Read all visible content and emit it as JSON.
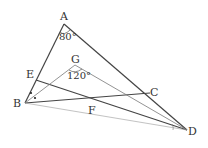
{
  "diagram": {
    "points": {
      "A": {
        "label": "A",
        "x": 64,
        "y": 24
      },
      "B": {
        "label": "B",
        "x": 25,
        "y": 103
      },
      "C": {
        "label": "C",
        "x": 150,
        "y": 93
      },
      "D": {
        "label": "D",
        "x": 187,
        "y": 130
      },
      "E": {
        "label": "E",
        "x": 36,
        "y": 80
      },
      "F": {
        "label": "F",
        "x": 96,
        "y": 103
      },
      "G": {
        "label": "G",
        "x": 75,
        "y": 65
      }
    },
    "angles": {
      "A": "80°",
      "G": "120°"
    },
    "colors": {
      "line": "#444444",
      "thin_line": "#777777",
      "text": "#333333"
    }
  }
}
